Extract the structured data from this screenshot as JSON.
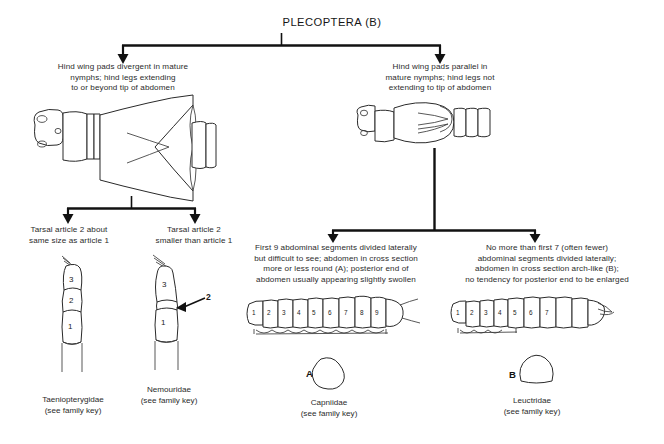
{
  "figure": {
    "title": "PLECOPTERA (B)",
    "type": "dichotomous-taxonomic-key",
    "order": "Plecoptera",
    "stage": "nymph"
  },
  "couplet_1": {
    "left": {
      "text": "Hind wing pads divergent in mature nymphs; hind legs extending to or beyond tip of abdomen",
      "lines": [
        "Hind wing pads divergent in mature",
        "nymphs; hind legs extending",
        "to or beyond tip of abdomen"
      ],
      "illustration": "nymph-dorsal-divergent-wingpads"
    },
    "right": {
      "text": "Hind wing pads parallel in mature nymphs; hind legs not extending to tip of abdomen",
      "lines": [
        "Hind wing pads parallel in",
        "mature nymphs; hind legs not",
        "extending to tip of abdomen"
      ],
      "illustration": "nymph-dorsal-parallel-wingpads"
    }
  },
  "couplet_2_left": {
    "left": {
      "lines": [
        "Tarsal article 2 about",
        "same size as article 1"
      ],
      "text": "Tarsal article 2 about same size as article 1",
      "illustration": "tarsus-equal-articles",
      "segment_labels": [
        "3",
        "2",
        "1"
      ],
      "family": "Taeniopterygidae",
      "family_note": "(see family key)"
    },
    "right": {
      "lines": [
        "Tarsal article 2",
        "smaller than article 1"
      ],
      "text": "Tarsal article 2 smaller than article 1",
      "illustration": "tarsus-short-second-article",
      "segment_labels": [
        "3",
        "2",
        "1"
      ],
      "callout_label": "2",
      "family": "Nemouridae",
      "family_note": "(see family key)"
    }
  },
  "couplet_2_right": {
    "left": {
      "lines": [
        "First 9 abdominal segments divided laterally",
        "but difficult to see; abdomen in cross section",
        "more or less round (A); posterior end of",
        "abdomen usually appearing slightly swollen"
      ],
      "text": "First 9 abdominal segments divided laterally but difficult to see; abdomen in cross section more or less round (A); posterior end of abdomen usually appearing slightly swollen",
      "illustration": "abdomen-lateral-capniidae",
      "segment_numbers": [
        "1",
        "2",
        "3",
        "4",
        "5",
        "6",
        "7",
        "8",
        "9"
      ],
      "cross_section_label": "A",
      "cross_section_shape": "rounded",
      "family": "Capniidae",
      "family_note": "(see family key)"
    },
    "right": {
      "lines": [
        "No more than first 7 (often fewer)",
        "abdominal segments divided laterally;",
        "abdomen in cross section arch-like (B);",
        "no tendency for posterior end to be enlarged"
      ],
      "text": "No more than first 7 (often fewer) abdominal segments divided laterally; abdomen in cross section arch-like (B); no tendency for posterior end to be enlarged",
      "illustration": "abdomen-lateral-leuctridae",
      "segment_numbers": [
        "1",
        "2",
        "3",
        "4",
        "5",
        "6",
        "7"
      ],
      "cross_section_label": "B",
      "cross_section_shape": "arch-like",
      "family": "Leuctridae",
      "family_note": "(see family key)"
    }
  },
  "style": {
    "line_color": "#111111",
    "ink_color": "#2a2a2a",
    "background": "#ffffff"
  }
}
